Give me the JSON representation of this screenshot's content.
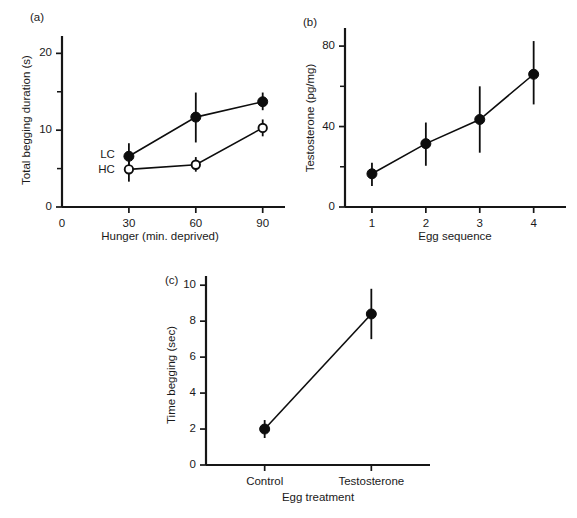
{
  "figure": {
    "background_color": "#ffffff",
    "ink_color": "#0d0d0d",
    "panels": [
      "a",
      "b",
      "c"
    ]
  },
  "chart_data": [
    {
      "type": "line",
      "panel": "a",
      "panel_label": "(a)",
      "title": "",
      "xlabel": "Hunger (min. deprived)",
      "ylabel": "Total begging duration (s)",
      "x": [
        30,
        60,
        90
      ],
      "xlim": [
        0,
        100
      ],
      "ylim": [
        0,
        22
      ],
      "xticks": [
        0,
        30,
        60,
        90
      ],
      "xtick_labels": [
        "0",
        "30",
        "60",
        "90"
      ],
      "yticks": [
        0,
        10,
        20
      ],
      "ytick_labels": [
        "0",
        "10",
        "20"
      ],
      "yticks_minor": [
        5,
        15
      ],
      "grid": false,
      "legend_position": "inline-left",
      "series": [
        {
          "name": "LC",
          "marker": "filled-circle",
          "values": [
            6.6,
            11.7,
            13.7
          ],
          "err_low": [
            5.1,
            8.4,
            12.6
          ],
          "err_high": [
            8.3,
            14.9,
            14.9
          ]
        },
        {
          "name": "HC",
          "marker": "open-circle",
          "values": [
            4.9,
            5.5,
            10.3
          ],
          "err_low": [
            3.3,
            4.6,
            9.2
          ],
          "err_high": [
            6.0,
            6.5,
            11.4
          ]
        }
      ]
    },
    {
      "type": "line",
      "panel": "b",
      "panel_label": "(b)",
      "title": "",
      "xlabel": "Egg sequence",
      "ylabel": "Testosterone (pg/mg)",
      "categories": [
        "1",
        "2",
        "3",
        "4"
      ],
      "x": [
        1,
        2,
        3,
        4
      ],
      "xlim": [
        0.5,
        4.6
      ],
      "ylim": [
        0,
        88
      ],
      "xticks": [
        1,
        2,
        3,
        4
      ],
      "xtick_labels": [
        "1",
        "2",
        "3",
        "4"
      ],
      "yticks": [
        0,
        40,
        80
      ],
      "ytick_labels": [
        "0",
        "40",
        "80"
      ],
      "yticks_minor": [
        20,
        60
      ],
      "grid": false,
      "legend_position": "none",
      "series": [
        {
          "name": "Testosterone",
          "marker": "filled-circle",
          "values": [
            16.5,
            31.5,
            43.5,
            66.0
          ],
          "err_low": [
            10.5,
            20.5,
            27.0,
            51.0
          ],
          "err_high": [
            22.0,
            42.0,
            60.0,
            82.5
          ]
        }
      ]
    },
    {
      "type": "line",
      "panel": "c",
      "panel_label": "(c)",
      "title": "",
      "xlabel": "Egg treatment",
      "ylabel": "Time begging (sec)",
      "categories": [
        "Control",
        "Testosterone"
      ],
      "x": [
        1,
        2
      ],
      "xlim": [
        0.45,
        2.55
      ],
      "ylim": [
        0,
        10.4
      ],
      "xticks": [
        1,
        2
      ],
      "xtick_labels": [
        "Control",
        "Testosterone"
      ],
      "yticks": [
        0,
        2,
        4,
        6,
        8,
        10
      ],
      "ytick_labels": [
        "0",
        "2",
        "4",
        "6",
        "8",
        "10"
      ],
      "yticks_minor": [],
      "grid": false,
      "legend_position": "none",
      "series": [
        {
          "name": "Time begging",
          "marker": "filled-circle",
          "values": [
            2.0,
            8.4
          ],
          "err_low": [
            1.5,
            7.0
          ],
          "err_high": [
            2.5,
            9.8
          ]
        }
      ]
    }
  ]
}
